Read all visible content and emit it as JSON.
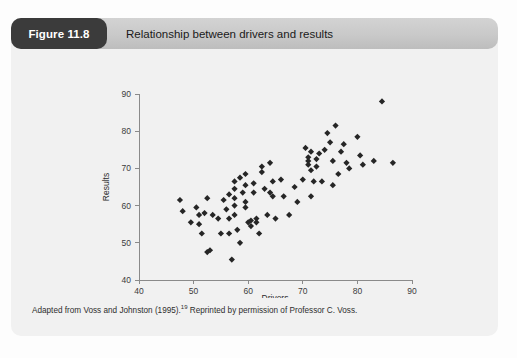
{
  "figure": {
    "number_label": "Figure 11.8",
    "title": "Relationship between drivers and results",
    "caption_before": "Adapted from Voss and Johnston (1995).",
    "caption_superscript": "19",
    "caption_after": " Reprinted by permission of Professor C. Voss.",
    "colors": {
      "tab_background": "#3b3b3b",
      "tab_text": "#ffffff",
      "header_background": "#c9c9c9",
      "card_background": "#f1f1f1",
      "marker": "#262626",
      "axis": "#8a8a8a"
    }
  },
  "chart_data": {
    "type": "scatter",
    "title": "Relationship between drivers and results",
    "xlabel": "Drivers",
    "ylabel": "Results",
    "xlim": [
      40,
      90
    ],
    "ylim": [
      40,
      90
    ],
    "xticks": [
      40,
      50,
      60,
      70,
      80,
      90
    ],
    "yticks": [
      40,
      50,
      60,
      70,
      80,
      90
    ],
    "grid": false,
    "legend": false,
    "marker": "diamond",
    "series": [
      {
        "name": "Observations",
        "points": [
          [
            47.5,
            61.5
          ],
          [
            48.0,
            58.5
          ],
          [
            49.5,
            55.5
          ],
          [
            50.5,
            59.5
          ],
          [
            51.0,
            57.5
          ],
          [
            51.0,
            55.0
          ],
          [
            51.5,
            52.5
          ],
          [
            52.0,
            58.0
          ],
          [
            52.5,
            62.0
          ],
          [
            52.5,
            47.5
          ],
          [
            53.0,
            48.0
          ],
          [
            53.5,
            57.5
          ],
          [
            54.5,
            56.5
          ],
          [
            55.0,
            52.5
          ],
          [
            55.5,
            61.5
          ],
          [
            56.0,
            59.0
          ],
          [
            56.5,
            63.0
          ],
          [
            56.5,
            56.5
          ],
          [
            56.5,
            52.5
          ],
          [
            57.0,
            45.5
          ],
          [
            57.5,
            66.5
          ],
          [
            57.5,
            64.5
          ],
          [
            57.5,
            62.0
          ],
          [
            57.5,
            60.0
          ],
          [
            57.5,
            57.5
          ],
          [
            58.0,
            53.5
          ],
          [
            58.5,
            67.5
          ],
          [
            58.5,
            50.0
          ],
          [
            59.0,
            63.5
          ],
          [
            59.5,
            68.5
          ],
          [
            59.5,
            65.5
          ],
          [
            59.5,
            61.0
          ],
          [
            59.5,
            59.5
          ],
          [
            60.0,
            55.5
          ],
          [
            60.5,
            56.0
          ],
          [
            60.5,
            54.5
          ],
          [
            61.0,
            66.0
          ],
          [
            61.0,
            63.5
          ],
          [
            61.5,
            56.5
          ],
          [
            61.5,
            55.5
          ],
          [
            62.0,
            52.5
          ],
          [
            62.5,
            70.5
          ],
          [
            62.5,
            69.0
          ],
          [
            63.0,
            64.5
          ],
          [
            63.5,
            57.5
          ],
          [
            64.0,
            71.5
          ],
          [
            64.0,
            63.5
          ],
          [
            64.5,
            66.5
          ],
          [
            64.5,
            62.5
          ],
          [
            65.0,
            56.5
          ],
          [
            66.0,
            67.0
          ],
          [
            66.5,
            62.5
          ],
          [
            67.5,
            57.5
          ],
          [
            68.5,
            65.0
          ],
          [
            69.0,
            61.0
          ],
          [
            70.0,
            67.0
          ],
          [
            70.5,
            75.5
          ],
          [
            71.0,
            73.0
          ],
          [
            71.0,
            72.0
          ],
          [
            71.0,
            71.0
          ],
          [
            71.5,
            74.5
          ],
          [
            71.5,
            69.5
          ],
          [
            71.5,
            62.5
          ],
          [
            72.0,
            66.5
          ],
          [
            72.5,
            72.5
          ],
          [
            72.5,
            70.5
          ],
          [
            73.0,
            74.0
          ],
          [
            73.5,
            66.5
          ],
          [
            74.0,
            75.0
          ],
          [
            74.5,
            79.5
          ],
          [
            75.0,
            77.0
          ],
          [
            75.5,
            72.0
          ],
          [
            75.5,
            65.5
          ],
          [
            76.0,
            81.5
          ],
          [
            76.5,
            68.5
          ],
          [
            77.0,
            74.5
          ],
          [
            77.5,
            76.5
          ],
          [
            78.0,
            71.5
          ],
          [
            78.5,
            70.0
          ],
          [
            80.0,
            78.5
          ],
          [
            80.5,
            73.5
          ],
          [
            81.0,
            71.0
          ],
          [
            83.0,
            72.0
          ],
          [
            84.5,
            88.0
          ],
          [
            86.5,
            71.5
          ]
        ]
      }
    ]
  }
}
